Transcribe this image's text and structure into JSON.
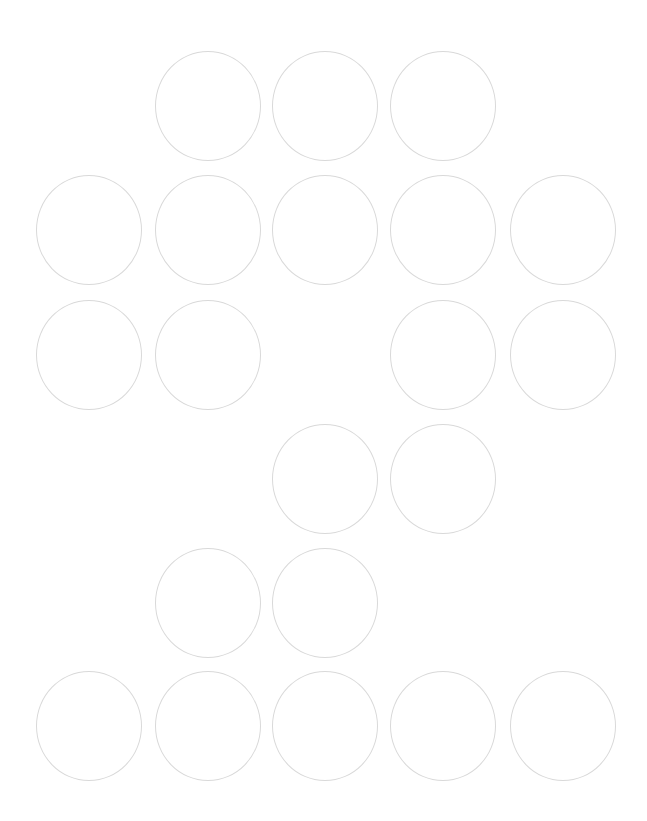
{
  "board": {
    "rows": 6,
    "columns": 5,
    "column_x": [
      36,
      155,
      272,
      390,
      510
    ],
    "row_y": [
      51,
      175,
      300,
      424,
      548,
      671
    ],
    "cell_width": 106,
    "cell_height": 110,
    "stroke_color": "#d9d9d9",
    "background_color": "#ffffff",
    "cells": [
      {
        "row": 1,
        "col": 2,
        "label": ""
      },
      {
        "row": 1,
        "col": 3,
        "label": ""
      },
      {
        "row": 1,
        "col": 4,
        "label": ""
      },
      {
        "row": 2,
        "col": 1,
        "label": ""
      },
      {
        "row": 2,
        "col": 2,
        "label": ""
      },
      {
        "row": 2,
        "col": 3,
        "label": ""
      },
      {
        "row": 2,
        "col": 4,
        "label": ""
      },
      {
        "row": 2,
        "col": 5,
        "label": ""
      },
      {
        "row": 3,
        "col": 1,
        "label": ""
      },
      {
        "row": 3,
        "col": 2,
        "label": ""
      },
      {
        "row": 3,
        "col": 4,
        "label": ""
      },
      {
        "row": 3,
        "col": 5,
        "label": ""
      },
      {
        "row": 4,
        "col": 3,
        "label": ""
      },
      {
        "row": 4,
        "col": 4,
        "label": ""
      },
      {
        "row": 5,
        "col": 2,
        "label": ""
      },
      {
        "row": 5,
        "col": 3,
        "label": ""
      },
      {
        "row": 6,
        "col": 1,
        "label": ""
      },
      {
        "row": 6,
        "col": 2,
        "label": ""
      },
      {
        "row": 6,
        "col": 3,
        "label": ""
      },
      {
        "row": 6,
        "col": 4,
        "label": ""
      },
      {
        "row": 6,
        "col": 5,
        "label": ""
      }
    ]
  }
}
